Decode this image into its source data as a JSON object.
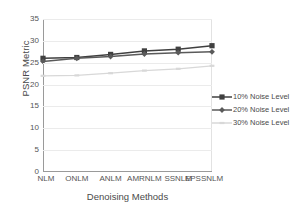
{
  "chart_data": {
    "type": "line",
    "title": "",
    "xlabel": "Denoising Methods",
    "ylabel": "PSNR Metric",
    "categories": [
      "NLM",
      "ONLM",
      "ANLM",
      "AMRNLM",
      "SSNLM",
      "EPSSNLM"
    ],
    "ylim": [
      0,
      35
    ],
    "yticks": [
      0,
      5,
      10,
      15,
      20,
      25,
      30,
      35
    ],
    "grid": true,
    "legend_position": "right",
    "series": [
      {
        "name": "10% Noise Level",
        "values": [
          26.0,
          26.2,
          26.9,
          27.7,
          28.1,
          28.9
        ],
        "color": "#404040",
        "marker": "square"
      },
      {
        "name": "20% Noise Level",
        "values": [
          25.3,
          26.0,
          26.4,
          27.0,
          27.3,
          27.5
        ],
        "color": "#5a5a5a",
        "marker": "diamond"
      },
      {
        "name": "30% Noise Level",
        "values": [
          22.0,
          22.1,
          22.6,
          23.2,
          23.6,
          24.3
        ],
        "color": "#d8d8d8",
        "marker": "dash"
      }
    ]
  },
  "axis": {
    "ylabel": "PSNR Metric",
    "xlabel": "Denoising Methods",
    "yticks": [
      "0",
      "5",
      "10",
      "15",
      "20",
      "25",
      "30",
      "35"
    ],
    "xticks": [
      "NLM",
      "ONLM",
      "ANLM",
      "AMRNLM",
      "SSNLM",
      "EPSSNLM"
    ]
  },
  "legend": {
    "items": [
      {
        "label": "10% Noise Level",
        "color": "#404040",
        "marker": "square-marker"
      },
      {
        "label": "20% Noise Level",
        "color": "#5a5a5a",
        "marker": "diamond-marker"
      },
      {
        "label": "30% Noise Level",
        "color": "#d8d8d8",
        "marker": "dash-marker"
      }
    ]
  },
  "colors": {
    "grid": "#ebebeb",
    "axis": "#9a9a9a",
    "text": "#4a4a4a"
  }
}
